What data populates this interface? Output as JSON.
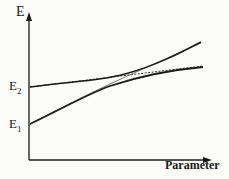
{
  "diagram": {
    "y_axis_label": "E",
    "x_axis_label": "Parameter",
    "levels": [
      {
        "label": "E",
        "subscript": "2"
      },
      {
        "label": "E",
        "subscript": "1"
      }
    ],
    "curves": [
      {
        "name": "upper-adiabatic",
        "style": "solid"
      },
      {
        "name": "lower-adiabatic",
        "style": "solid"
      },
      {
        "name": "diabatic-E2",
        "style": "dashed"
      },
      {
        "name": "diabatic-E1",
        "style": "dashed"
      }
    ],
    "colors": {
      "line": "#1a1a1a",
      "background": "#fbfbf9"
    }
  }
}
